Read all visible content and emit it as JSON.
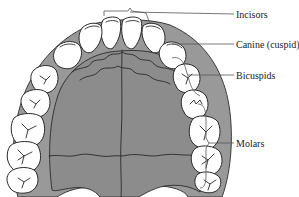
{
  "figure": {
    "colors": {
      "palate": "#8c8c8c",
      "gum": "#9a9a9a",
      "outline": "#2a2a2a",
      "tooth": "#ffffff",
      "leader": "#555555",
      "text": "#222222"
    },
    "labels": [
      {
        "id": "incisors",
        "text": "Incisors"
      },
      {
        "id": "canine",
        "text": "Canine (cuspid)"
      },
      {
        "id": "bicuspids",
        "text": "Bicuspids"
      },
      {
        "id": "molars",
        "text": "Molars"
      }
    ]
  }
}
